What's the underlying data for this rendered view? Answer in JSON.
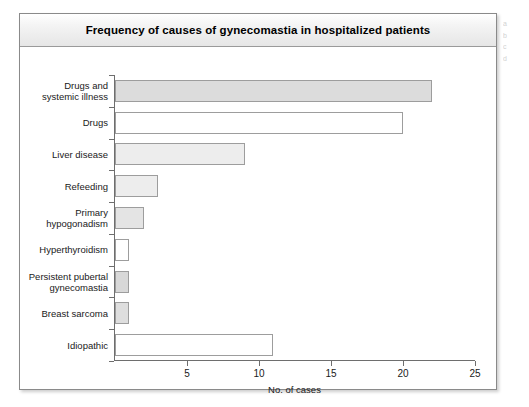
{
  "figure": {
    "title": "Frequency of causes of gynecomastia in hospitalized patients",
    "frame_border_color": "#8a8a8a",
    "title_band_color": "#e6e6e6",
    "background_color": "#ffffff"
  },
  "margin_note": {
    "line1": "a",
    "line2": "b",
    "line3": "c",
    "line4": "d"
  },
  "chart_data": {
    "type": "bar",
    "orientation": "horizontal",
    "title": "Frequency of causes of gynecomastia in hospitalized patients",
    "xlabel": "No. of cases",
    "ylabel": "",
    "xlim": [
      0,
      25
    ],
    "xticks": [
      5,
      10,
      15,
      20,
      25
    ],
    "grid": false,
    "legend": null,
    "categories": [
      "Drugs and\nsystemic illness",
      "Drugs",
      "Liver disease",
      "Refeeding",
      "Primary\nhypogonadism",
      "Hyperthyroidism",
      "Persistent pubertal\ngynecomastia",
      "Breast sarcoma",
      "Idiopathic"
    ],
    "values": [
      22,
      20,
      9,
      3,
      2,
      1,
      1,
      1,
      11
    ],
    "bar_fills": [
      "#dcdcdc",
      "#ffffff",
      "#ededed",
      "#ededed",
      "#e4e4e4",
      "#ffffff",
      "#d8d8d8",
      "#dedede",
      "#ffffff"
    ],
    "bar_edge_color": "#9d9d9d",
    "axis_color": "#6e6e6e"
  }
}
